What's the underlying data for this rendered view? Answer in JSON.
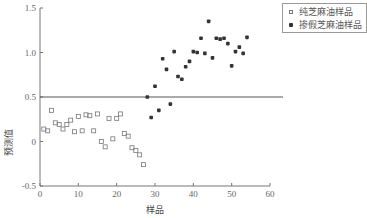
{
  "chart_data": {
    "type": "scatter",
    "title": "",
    "xlabel": "样品",
    "ylabel": "预测值",
    "xlim": [
      0,
      60
    ],
    "ylim": [
      -0.5,
      1.5
    ],
    "xticks": [
      0,
      10,
      20,
      30,
      40,
      50,
      60
    ],
    "yticks": [
      -0.5,
      0,
      0.5,
      1.0,
      1.5
    ],
    "xtick_labels": [
      "0",
      "10",
      "20",
      "30",
      "40",
      "50",
      "60"
    ],
    "ytick_labels": [
      "-0.5",
      "0",
      "0.5",
      "1.0",
      "1.5"
    ],
    "grid": false,
    "legend_position": "upper right (outside)",
    "threshold_line": {
      "y": 0.5,
      "label": ""
    },
    "series": [
      {
        "name": "纯芝麻油样品",
        "marker": "open-square",
        "x": [
          1,
          2,
          3,
          4,
          5,
          6,
          7,
          8,
          9,
          10,
          11,
          12,
          13,
          14,
          15,
          16,
          17,
          18,
          19,
          20,
          21,
          22,
          23,
          24,
          25,
          26,
          27
        ],
        "y": [
          0.14,
          0.12,
          0.35,
          0.21,
          0.19,
          0.14,
          0.19,
          0.24,
          0.11,
          0.28,
          0.12,
          0.3,
          0.29,
          0.12,
          0.31,
          0.0,
          -0.06,
          0.26,
          0.03,
          0.26,
          0.31,
          0.09,
          0.06,
          -0.07,
          -0.1,
          -0.15,
          -0.26
        ]
      },
      {
        "name": "掺假芝麻油样品",
        "marker": "filled-star",
        "x": [
          28,
          29,
          30,
          31,
          32,
          33,
          34,
          35,
          36,
          37,
          38,
          39,
          40,
          41,
          42,
          43,
          44,
          45,
          46,
          47,
          48,
          49,
          50,
          51,
          52,
          53,
          54
        ],
        "y": [
          0.5,
          0.27,
          0.62,
          0.35,
          0.93,
          0.81,
          0.42,
          1.01,
          0.73,
          0.7,
          0.84,
          0.9,
          1.01,
          1.0,
          1.16,
          0.99,
          1.35,
          0.94,
          1.16,
          1.15,
          1.16,
          1.1,
          0.85,
          1.01,
          1.06,
          0.99,
          1.17
        ]
      }
    ]
  },
  "legend": {
    "items": [
      {
        "label": "纯芝麻油样品",
        "marker": "open-square"
      },
      {
        "label": "掺假芝麻油样品",
        "marker": "filled-star"
      }
    ]
  },
  "colors": {
    "axis": "#777777",
    "threshold_line": "#555555",
    "square_marker": "#777777",
    "star_marker": "#333333"
  }
}
